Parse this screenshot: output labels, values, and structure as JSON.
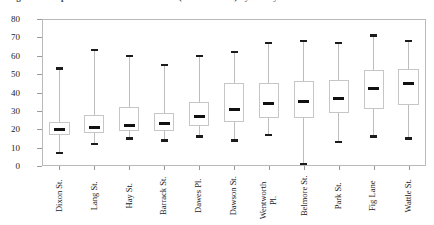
{
  "caption": {
    "text": "Figure 5.  Boxplots of diurnal traffic counts (vehicles/hour) by survey location"
  },
  "chart_data": {
    "type": "box",
    "title": "",
    "xlabel": "",
    "ylabel": "",
    "ylim": [
      0,
      80
    ],
    "yticks": [
      0,
      10,
      20,
      30,
      40,
      50,
      60,
      70,
      80
    ],
    "ytick_labels": [
      "0",
      "10",
      "20",
      "30",
      "40",
      "50",
      "60",
      "70",
      "80"
    ],
    "grid": false,
    "legend": false,
    "frame": true,
    "categories": [
      "Dixon St.",
      "Lang St.",
      "Hay St.",
      "Barrack St.",
      "Dawes Pl.",
      "Dawson St.",
      "Wentworth\nPl.",
      "Belmore St.",
      "Park St.",
      "Fig Lane",
      "Wattle St."
    ],
    "boxes": [
      {
        "name": "Dixon St.",
        "min": 7,
        "q1": 17,
        "median": 20,
        "q3": 24,
        "max": 53
      },
      {
        "name": "Lang St.",
        "min": 12,
        "q1": 18,
        "median": 21,
        "q3": 28,
        "max": 63
      },
      {
        "name": "Hay St.",
        "min": 15,
        "q1": 19,
        "median": 22,
        "q3": 32,
        "max": 60
      },
      {
        "name": "Barrack St.",
        "min": 14,
        "q1": 19,
        "median": 23,
        "q3": 29,
        "max": 55
      },
      {
        "name": "Dawes Pl.",
        "min": 16,
        "q1": 22,
        "median": 27,
        "q3": 35,
        "max": 60
      },
      {
        "name": "Dawson St.",
        "min": 14,
        "q1": 24,
        "median": 31,
        "q3": 45,
        "max": 62
      },
      {
        "name": "Wentworth Pl.",
        "min": 17,
        "q1": 26,
        "median": 34,
        "q3": 45,
        "max": 67
      },
      {
        "name": "Belmore St.",
        "min": 1,
        "q1": 26,
        "median": 35,
        "q3": 46,
        "max": 68
      },
      {
        "name": "Park St.",
        "min": 13,
        "q1": 29,
        "median": 37,
        "q3": 47,
        "max": 67
      },
      {
        "name": "Fig Lane",
        "min": 16,
        "q1": 31,
        "median": 42,
        "q3": 52,
        "max": 71
      },
      {
        "name": "Wattle St.",
        "min": 15,
        "q1": 33,
        "median": 45,
        "q3": 53,
        "max": 68
      }
    ]
  },
  "style": {
    "frame_color": "#b9b9b9",
    "box_color": "#c6c6c6",
    "whisker_color": "#bdbdbd",
    "marker_color": "#111111",
    "background": "#ffffff"
  }
}
